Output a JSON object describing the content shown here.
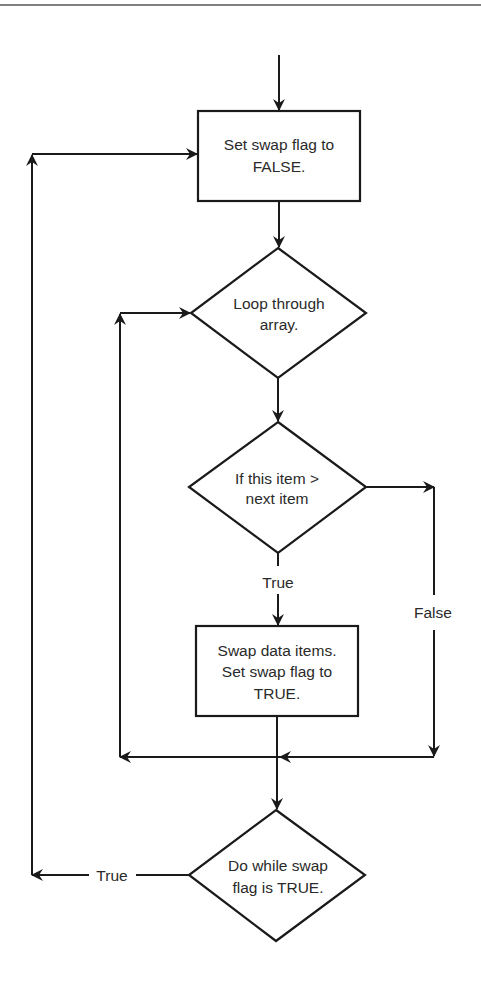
{
  "diagram": {
    "type": "flowchart",
    "colors": {
      "stroke": "#1a1a1a",
      "text": "#2a2a2a",
      "background": "#ffffff"
    },
    "nodes": {
      "set_false": {
        "shape": "process",
        "line1": "Set swap flag to",
        "line2": "FALSE."
      },
      "loop_array": {
        "shape": "decision",
        "line1": "Loop through",
        "line2": "array."
      },
      "compare": {
        "shape": "decision",
        "line1": "If this item >",
        "line2": "next item"
      },
      "swap": {
        "shape": "process",
        "line1": "Swap data items.",
        "line2": "Set swap flag to",
        "line3": "TRUE."
      },
      "do_while": {
        "shape": "decision",
        "line1": "Do while swap",
        "line2": "flag is TRUE."
      }
    },
    "edge_labels": {
      "compare_true": "True",
      "compare_false": "False",
      "do_while_true": "True"
    },
    "edges": [
      {
        "from": "start",
        "to": "set_false"
      },
      {
        "from": "set_false",
        "to": "loop_array"
      },
      {
        "from": "loop_array",
        "to": "compare"
      },
      {
        "from": "compare",
        "to": "swap",
        "label": "True"
      },
      {
        "from": "compare",
        "to": "merge",
        "label": "False"
      },
      {
        "from": "swap",
        "to": "merge"
      },
      {
        "from": "merge",
        "to": "loop_array"
      },
      {
        "from": "merge",
        "to": "do_while"
      },
      {
        "from": "do_while",
        "to": "set_false",
        "label": "True"
      }
    ]
  }
}
